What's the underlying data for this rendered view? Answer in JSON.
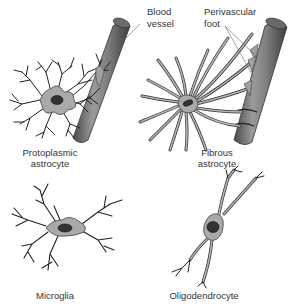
{
  "figure": {
    "labels": {
      "blood_vessel": [
        "Blood",
        "vessel"
      ],
      "perivascular_foot": [
        "Perivascular",
        "foot"
      ],
      "protoplasmic_astrocyte": [
        "Protoplasmic",
        "astrocyte"
      ],
      "fibrous_astrocyte": [
        "Fibrous",
        "astrocyte"
      ],
      "microglia": "Microglia",
      "oligodendrocyte": "Oligodendrocyte"
    },
    "colors": {
      "vessel": "#7a7a7a",
      "cell_body": "#a9a9a9",
      "nucleus": "#333333",
      "text": "#333333"
    }
  }
}
